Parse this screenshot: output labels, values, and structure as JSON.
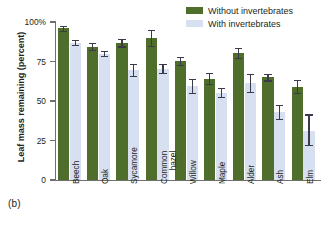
{
  "figure": {
    "panel_label": "(b)",
    "ylabel": "Leaf mass remaining (percent)"
  },
  "legend": {
    "position": "top-right",
    "items": [
      {
        "label": "Without invertebrates",
        "color": "#4f6e2c",
        "key": "without"
      },
      {
        "label": "With invertebrates",
        "color": "#d7e0f1",
        "key": "with"
      }
    ]
  },
  "axis": {
    "ticks": [
      {
        "value": 0,
        "label": "0"
      },
      {
        "value": 25,
        "label": "25"
      },
      {
        "value": 50,
        "label": "50"
      },
      {
        "value": 75,
        "label": "75"
      },
      {
        "value": 100,
        "label": "100%"
      }
    ]
  },
  "chart_data": {
    "type": "bar",
    "title": "",
    "xlabel": "",
    "ylabel": "Leaf mass remaining (percent)",
    "ylim": [
      0,
      100
    ],
    "grid": false,
    "legend_position": "top-right",
    "annotations": [
      "(b)"
    ],
    "categories": [
      "Beech",
      "Oak",
      "Sycamore",
      "Common hazel",
      "Willow",
      "Maple",
      "Alder",
      "Ash",
      "Elm"
    ],
    "ytick_labels": [
      "0",
      "25",
      "50",
      "75",
      "100%"
    ],
    "series": [
      {
        "name": "Without invertebrates",
        "color": "#4f6e2c",
        "values": [
          96,
          84.5,
          87,
          90,
          75.5,
          64,
          80.5,
          65,
          59
        ],
        "error_low": [
          94.5,
          82.5,
          84.5,
          85,
          73,
          61,
          77,
          63,
          55
        ],
        "error_high": [
          97.5,
          86.5,
          89,
          95,
          78,
          67.5,
          83.5,
          67,
          63.5
        ]
      },
      {
        "name": "With invertebrates",
        "color": "#d7e0f1",
        "values": [
          87,
          80,
          69.5,
          70,
          59.5,
          55,
          61.5,
          43,
          31
        ],
        "error_low": [
          85.5,
          78.5,
          66,
          67.5,
          55,
          52.5,
          56,
          38.5,
          22
        ],
        "error_high": [
          88.5,
          81.5,
          73.5,
          73.5,
          64,
          58,
          67,
          47.5,
          41.5
        ]
      }
    ]
  }
}
